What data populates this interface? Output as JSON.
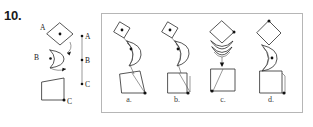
{
  "question": {
    "number": "10.",
    "type": "multiple-choice-figure"
  },
  "key": {
    "shapes": [
      {
        "id": "A",
        "label": "A",
        "icon": "diamond-with-center-dot",
        "description": "diamond (square rotated 45 degrees) with a dot at its center"
      },
      {
        "id": "B",
        "label": "B",
        "icon": "crescent-with-dot",
        "description": "crescent / arc shape with a dot at its left point"
      },
      {
        "id": "C",
        "label": "C",
        "icon": "trapezoid-with-corner-dot",
        "description": "quadrilateral / trapezoid with a dot at its lower-right corner"
      }
    ],
    "axis": {
      "name": "vertical-scale",
      "ticks": [
        {
          "label": "A",
          "position": "top"
        },
        {
          "label": "B",
          "position": "middle"
        },
        {
          "label": "C",
          "position": "bottom"
        }
      ]
    }
  },
  "answers": {
    "options": [
      {
        "id": "a",
        "label": "a.",
        "arrangement": "diamond upper-left tilted, crescent middle, trapezoid lower with dot at lower-right; pivot dots connected by a diagonal chain leaning right"
      },
      {
        "id": "b",
        "label": "b.",
        "arrangement": "diamond upper-left tilted, crescent middle, trapezoid lower with dot at bottom-right corner; chain leans right"
      },
      {
        "id": "c",
        "label": "c.",
        "arrangement": "diamond on top with dot at right vertex, crescents stacked below, square at bottom with dot at lower-left; vertically aligned"
      },
      {
        "id": "d",
        "label": "d.",
        "arrangement": "diamond on top with dot at top vertex, crescent in middle, square at bottom with dot at lower-right; vertically aligned column"
      }
    ]
  },
  "colors": {
    "ink": "#2b2b2b",
    "frame": "#b6b6b6",
    "background": "#ffffff"
  }
}
